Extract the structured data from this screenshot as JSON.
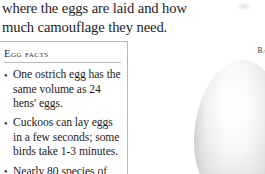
{
  "page": {
    "background": "#ffffff",
    "text_color": "#1d1d1d"
  },
  "body_copy": {
    "paragraph": "where the eggs are laid and how much camouflage they need."
  },
  "egg_facts": {
    "heading": "EGG FACTS",
    "bullet_glyph": "•",
    "items": [
      "One ostrich egg has the same volume as 24 hens' eggs.",
      "Cuckoos can lay eggs in a few seconds; some birds take 1-3 minutes.",
      "Nearly 80 species of bird lay eggs in the"
    ],
    "border_color": "#b9b9b9",
    "rule_color": "#bdbdbd"
  },
  "figure": {
    "caption_line1": "BARN OWL",
    "caption_line2": "EGG",
    "shell_color": "#f2f2f2",
    "shadow_color": "#9a9a9a"
  }
}
